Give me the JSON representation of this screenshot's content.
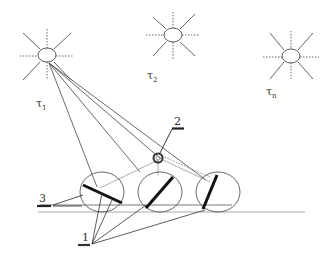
{
  "diagram": {
    "sources": [
      {
        "id": "tau1",
        "label": "τ",
        "sub": "1",
        "cx": 47,
        "cy": 55
      },
      {
        "id": "tau2",
        "label": "τ",
        "sub": "2",
        "cx": 173,
        "cy": 35
      },
      {
        "id": "taun",
        "label": "τ",
        "sub": "n",
        "cx": 291,
        "cy": 56
      }
    ],
    "callouts": {
      "label1": "1",
      "label2": "2",
      "label3": "3"
    },
    "colors": {
      "line": "#444444",
      "light_line": "#aaaaaa",
      "bold_bar": "#111111"
    }
  }
}
